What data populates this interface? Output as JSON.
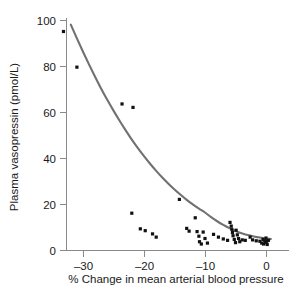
{
  "chart_data": {
    "type": "scatter",
    "title": "",
    "xlabel": "% Change in mean arterial blood pressure",
    "ylabel": "Plasma vasopressin (pmol/L)",
    "xlim": [
      -34.5,
      1.5
    ],
    "ylim": [
      0,
      103
    ],
    "xticks": [
      -30,
      -20,
      -10,
      0
    ],
    "xtick_labels": [
      "–30",
      "–20",
      "–10",
      "0"
    ],
    "yticks": [
      0,
      20,
      40,
      60,
      80,
      100
    ],
    "ytick_labels": [
      "0",
      "20",
      "40",
      "60",
      "80",
      "100"
    ],
    "grid": false,
    "legend": null,
    "marker": "square",
    "marker_color": "#111111",
    "curve_color": "#717171",
    "axis_color": "#8a8a8a",
    "points": [
      [
        -33.2,
        95.0
      ],
      [
        -31.0,
        79.5
      ],
      [
        -23.6,
        63.5
      ],
      [
        -21.8,
        62.0
      ],
      [
        -22.0,
        16.0
      ],
      [
        -20.6,
        9.2
      ],
      [
        -19.8,
        8.4
      ],
      [
        -18.6,
        7.0
      ],
      [
        -18.0,
        5.6
      ],
      [
        -14.2,
        22.0
      ],
      [
        -13.0,
        9.4
      ],
      [
        -12.6,
        8.2
      ],
      [
        -11.6,
        14.0
      ],
      [
        -11.3,
        8.0
      ],
      [
        -11.0,
        6.0
      ],
      [
        -10.9,
        3.6
      ],
      [
        -10.6,
        2.6
      ],
      [
        -10.3,
        7.8
      ],
      [
        -10.0,
        5.0
      ],
      [
        -9.6,
        3.0
      ],
      [
        -8.6,
        6.8
      ],
      [
        -7.8,
        5.6
      ],
      [
        -7.0,
        4.8
      ],
      [
        -6.3,
        4.2
      ],
      [
        -5.9,
        12.0
      ],
      [
        -5.7,
        10.4
      ],
      [
        -5.6,
        9.0
      ],
      [
        -5.5,
        7.6
      ],
      [
        -5.4,
        6.2
      ],
      [
        -5.2,
        4.6
      ],
      [
        -5.0,
        3.2
      ],
      [
        -4.9,
        8.6
      ],
      [
        -4.7,
        6.6
      ],
      [
        -4.5,
        5.0
      ],
      [
        -4.3,
        3.6
      ],
      [
        -3.9,
        4.4
      ],
      [
        -3.4,
        4.2
      ],
      [
        -2.6,
        5.6
      ],
      [
        -2.2,
        4.4
      ],
      [
        -1.6,
        4.0
      ],
      [
        -1.0,
        3.8
      ],
      [
        -0.7,
        3.0
      ],
      [
        -0.5,
        4.6
      ],
      [
        -0.4,
        2.6
      ],
      [
        -0.2,
        4.0
      ],
      [
        -0.1,
        3.2
      ],
      [
        0.0,
        5.2
      ],
      [
        0.1,
        3.8
      ],
      [
        0.2,
        2.4
      ],
      [
        0.4,
        4.2
      ]
    ],
    "fit_curve": {
      "description": "exponential decay fit",
      "points": [
        [
          -32.0,
          98.0
        ],
        [
          -31.0,
          92.0
        ],
        [
          -30.0,
          86.2
        ],
        [
          -29.0,
          80.6
        ],
        [
          -28.0,
          75.2
        ],
        [
          -27.0,
          70.0
        ],
        [
          -26.0,
          65.2
        ],
        [
          -25.0,
          60.6
        ],
        [
          -24.0,
          56.2
        ],
        [
          -23.0,
          52.0
        ],
        [
          -22.0,
          48.0
        ],
        [
          -21.0,
          44.3
        ],
        [
          -20.0,
          40.8
        ],
        [
          -19.0,
          37.5
        ],
        [
          -18.0,
          34.4
        ],
        [
          -17.0,
          31.5
        ],
        [
          -16.0,
          28.8
        ],
        [
          -15.0,
          26.3
        ],
        [
          -14.0,
          24.0
        ],
        [
          -13.0,
          21.8
        ],
        [
          -12.0,
          19.8
        ],
        [
          -11.0,
          18.0
        ],
        [
          -10.0,
          16.3
        ],
        [
          -9.0,
          14.3
        ],
        [
          -8.0,
          12.5
        ],
        [
          -7.0,
          10.9
        ],
        [
          -6.0,
          9.5
        ],
        [
          -5.0,
          8.3
        ],
        [
          -4.0,
          7.3
        ],
        [
          -3.0,
          6.5
        ],
        [
          -2.0,
          5.9
        ],
        [
          -1.0,
          5.4
        ],
        [
          0.0,
          5.0
        ],
        [
          0.8,
          4.8
        ]
      ]
    }
  }
}
